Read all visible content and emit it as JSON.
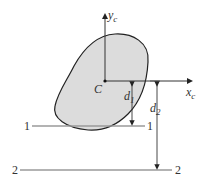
{
  "diagram": {
    "centroid_label": "C",
    "y_axis": {
      "label": "y",
      "subscript": "c"
    },
    "x_axis": {
      "label": "x",
      "subscript": "c"
    },
    "distances": [
      {
        "label": "d",
        "subscript": "1"
      },
      {
        "label": "d",
        "subscript": "2"
      }
    ],
    "lines": [
      {
        "left_label": "1",
        "right_label": "1"
      },
      {
        "left_label": "2",
        "right_label": "2"
      }
    ],
    "colors": {
      "shape_fill": "#dcdcdc",
      "shape_stroke": "#222222",
      "axis": "#333333",
      "reference_line": "#9a9a9a"
    }
  }
}
